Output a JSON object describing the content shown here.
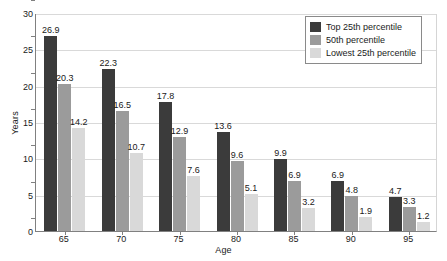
{
  "chart_data": {
    "type": "bar",
    "title": "",
    "xlabel": "Age",
    "ylabel": "Years",
    "categories": [
      "65",
      "70",
      "75",
      "80",
      "85",
      "90",
      "95"
    ],
    "series": [
      {
        "name": "Top 25th percentile",
        "color": "#3b3b3b",
        "values": [
          26.9,
          22.3,
          17.8,
          13.6,
          9.9,
          6.9,
          4.7
        ]
      },
      {
        "name": "50th percentile",
        "color": "#9b9b9b",
        "values": [
          20.3,
          16.5,
          12.9,
          9.6,
          6.9,
          4.8,
          3.3
        ]
      },
      {
        "name": "Lowest 25th percentile",
        "color": "#d9d9d9",
        "values": [
          14.2,
          10.7,
          7.6,
          5.1,
          3.2,
          1.9,
          1.2
        ]
      }
    ],
    "ylim": [
      0,
      30
    ],
    "yticks": [
      "0",
      "5",
      "10",
      "15",
      "20",
      "25",
      "30"
    ],
    "grid": true,
    "legend_position": "top-right",
    "data_labels": true
  },
  "legend": {
    "items": [
      {
        "label": "Top 25th percentile"
      },
      {
        "label": "50th percentile"
      },
      {
        "label": "Lowest 25th percentile"
      }
    ]
  },
  "axes": {
    "y_title": "Years",
    "x_title": "Age"
  }
}
